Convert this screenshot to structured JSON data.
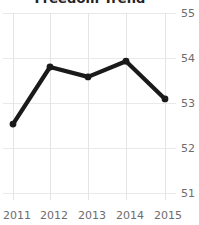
{
  "chart_data": {
    "type": "line",
    "title": "Freedom Trend",
    "xlabel": "",
    "ylabel": "",
    "categories": [
      "2011",
      "2012",
      "2013",
      "2014",
      "2015"
    ],
    "values": [
      52.53,
      53.8,
      53.58,
      53.93,
      53.09
    ],
    "series": [
      {
        "name": "Freedom Trend",
        "values": [
          52.53,
          53.8,
          53.58,
          53.93,
          53.09
        ]
      }
    ],
    "x_tick_labels": [
      "2011",
      "2012",
      "2013",
      "2014",
      "2015"
    ],
    "y_tick_labels": [
      "55",
      "54",
      "53",
      "52",
      "51"
    ],
    "y_ticks": [
      55,
      54,
      53,
      52,
      51
    ],
    "ylim": [
      51,
      55
    ],
    "grid": true,
    "legend": "none",
    "y_axis_position": "right",
    "line_color": "#1a1a1a",
    "grid_color": "#e9e9e9",
    "background_color": "#ffffff",
    "marker": "circle",
    "title_clipped": true
  }
}
